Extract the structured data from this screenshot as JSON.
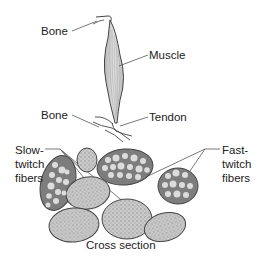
{
  "labels": {
    "bone_top": "Bone",
    "muscle": "Muscle",
    "bone_bottom": "Bone",
    "tendon": "Tendon",
    "slow_line1": "Slow-",
    "slow_line2": "twitch",
    "slow_line3": "fibers",
    "fast_line1": "Fast-",
    "fast_line2": "twitch",
    "fast_line3": "fibers",
    "cross_section": "Cross section"
  },
  "colors": {
    "line": "#444444",
    "muscle_fill": "#d4d4d4",
    "fast_fiber_fill": "#7a7a7a",
    "slow_fiber_fill": "#c8c8c8",
    "dot_light": "#e2e2e2"
  }
}
